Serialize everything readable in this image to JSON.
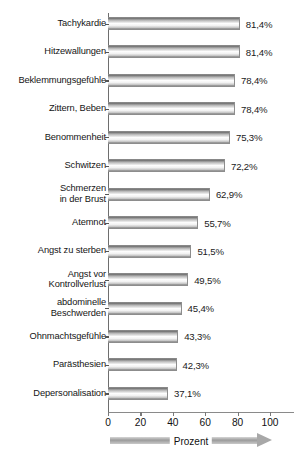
{
  "chart_data": {
    "type": "bar",
    "orientation": "horizontal",
    "title": "",
    "xlabel": "Prozent",
    "ylabel": "",
    "xlim": [
      0,
      100
    ],
    "xticks": [
      0,
      20,
      40,
      60,
      80,
      100
    ],
    "xtick_labels": [
      "0",
      "20",
      "40",
      "60",
      "80",
      "100"
    ],
    "grid": false,
    "legend": null,
    "value_suffix": "%",
    "decimal_separator": ",",
    "categories": [
      "Tachykardie",
      "Hitzewallungen",
      "Beklemmungsgefühle",
      "Zittern, Beben",
      "Benommenheit",
      "Schwitzen",
      "Schmerzen\nin der Brust",
      "Atemnot",
      "Angst zu sterben",
      "Angst vor\nKontrollverlust",
      "abdominelle\nBeschwerden",
      "Ohnmachtsgefühle",
      "Parästhesien",
      "Depersonalisation"
    ],
    "values": [
      81.4,
      81.4,
      78.4,
      78.4,
      75.3,
      72.2,
      62.9,
      55.7,
      51.5,
      49.5,
      45.4,
      43.3,
      42.3,
      37.1
    ],
    "value_labels": [
      "81,4%",
      "81,4%",
      "78,4%",
      "78,4%",
      "75,3%",
      "72,2%",
      "62,9%",
      "55,7%",
      "51,5%",
      "49,5%",
      "45,4%",
      "43,3%",
      "42,3%",
      "37,1%"
    ],
    "colors": {
      "bar_light": "#fdfdfd",
      "bar_dark": "#6f6f6f",
      "axis": "#6e6e6e",
      "text": "#1a1a1a",
      "arrow": "#a8a8a8"
    }
  }
}
